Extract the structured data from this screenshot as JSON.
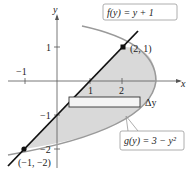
{
  "figure": {
    "x_axis_label": "x",
    "y_axis_label": "y",
    "x_ticks": [
      {
        "value": -1,
        "label": "−1"
      },
      {
        "value": 1,
        "label": "1"
      },
      {
        "value": 2,
        "label": "2"
      }
    ],
    "y_ticks": [
      {
        "value": 1,
        "label": "1"
      },
      {
        "value": -1,
        "label": "−1"
      },
      {
        "value": -2,
        "label": "−2"
      }
    ],
    "curves": {
      "line": {
        "label": "f(y) = y + 1"
      },
      "parabola": {
        "label": "g(y) = 3 − y²"
      }
    },
    "points": [
      {
        "label": "(2, 1)"
      },
      {
        "label": "(−1, −2)"
      }
    ],
    "strip_label": "Δy",
    "colors": {
      "shade": "#d9d9d9",
      "line": "#111111",
      "parabola": "#9a9a9a",
      "axis": "#555555"
    }
  }
}
